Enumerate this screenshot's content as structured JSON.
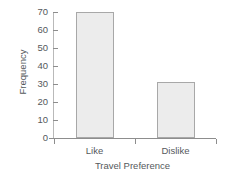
{
  "chart_data": {
    "type": "bar",
    "title": "",
    "subtitle": "",
    "categories": [
      "Like",
      "Dislike"
    ],
    "values": [
      70,
      31
    ],
    "xlabel": "Travel Preference",
    "ylabel": "Frequency",
    "ylim": [
      0,
      70
    ],
    "yticks": [
      0,
      10,
      20,
      30,
      40,
      50,
      60,
      70
    ],
    "ytick_labels": [
      "0",
      "10",
      "20",
      "30",
      "40",
      "50",
      "60",
      "70"
    ],
    "grid": false,
    "legend": null,
    "annotations": [],
    "colors": {
      "bar_fill": "#ececec",
      "bar_edge": "#a8a8a8",
      "axis": "#8d8d8d",
      "text": "#55595c",
      "background": "#ffffff"
    }
  }
}
